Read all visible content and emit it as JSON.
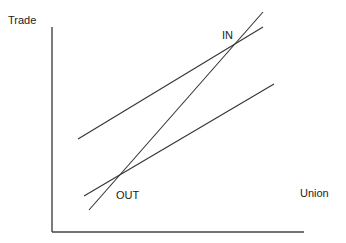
{
  "diagram": {
    "y_axis_label": "Trade",
    "x_axis_label": "Union",
    "points": [
      {
        "id": "in",
        "label": "IN"
      },
      {
        "id": "out",
        "label": "OUT"
      }
    ],
    "lines": [
      {
        "id": "upper-line",
        "description": "upper shallow line passing through IN"
      },
      {
        "id": "steep-line",
        "description": "steep line passing through OUT and IN"
      },
      {
        "id": "lower-line",
        "description": "lower shallow line passing through OUT"
      }
    ],
    "colors": {
      "line": "#333333",
      "text": "#222222",
      "background": "#ffffff"
    }
  }
}
